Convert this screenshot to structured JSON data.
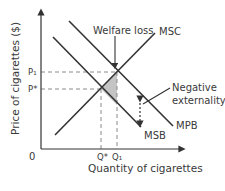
{
  "diagram": {
    "type": "negative-externality-of-consumption",
    "axes": {
      "y_label": "Price of cigarettes ($)",
      "x_label": "Quantity of cigarettes",
      "origin": "0"
    },
    "price_ticks": [
      {
        "label": "P₁",
        "y": 72
      },
      {
        "label": "P*",
        "y": 89
      }
    ],
    "quantity_ticks": [
      {
        "label": "Q*",
        "x": 101
      },
      {
        "label": "Q₁",
        "x": 117
      }
    ],
    "curves": [
      {
        "name": "MSC",
        "label": "MSC",
        "x1": 55,
        "y1": 135,
        "x2": 155,
        "y2": 33
      },
      {
        "name": "MPB",
        "label": "MPB",
        "x1": 69,
        "y1": 21,
        "x2": 173,
        "y2": 126
      },
      {
        "name": "MSB",
        "label": "MSB",
        "x1": 53,
        "y1": 37,
        "x2": 141,
        "y2": 127
      }
    ],
    "annotations": {
      "welfare_loss": "Welfare loss",
      "negative": "Negative",
      "externality": "externality"
    },
    "colors": {
      "line": "#333333",
      "dash": "#8a8a8a",
      "shade": "#c4c4c4",
      "text": "#3a3a3a"
    }
  }
}
